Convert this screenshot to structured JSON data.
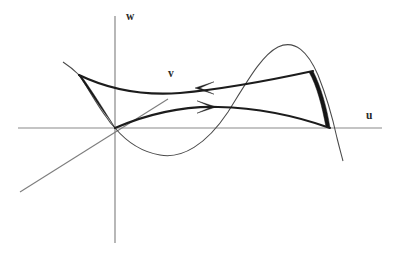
{
  "figure": {
    "title": "",
    "kind": "mathematical-diagram",
    "background_color": "#ffffff",
    "width": 402,
    "height": 258
  },
  "axes": {
    "horizontal": {
      "name": "u-axis",
      "label": "u",
      "label_position": {
        "x": 366,
        "y": 110
      },
      "start": {
        "x": 18,
        "y": 128
      },
      "end": {
        "x": 382,
        "y": 128
      },
      "color": "#8a8a8a"
    },
    "vertical": {
      "name": "w-axis",
      "label": "w",
      "label_position": {
        "x": 126,
        "y": 11
      },
      "start": {
        "x": 115,
        "y": 16
      },
      "end": {
        "x": 115,
        "y": 243
      },
      "color": "#7d7d7d"
    },
    "diagonal": {
      "name": "v-axis",
      "label": "v",
      "label_position": {
        "x": 168,
        "y": 68
      },
      "start": {
        "x": 20,
        "y": 192
      },
      "end": {
        "x": 168,
        "y": 99
      },
      "color": "#7d7d7d"
    }
  },
  "curves": [
    {
      "name": "thin-s-curve",
      "style": "thin",
      "color": "#4a4a4a",
      "note": "sinusoidal fold curve passing through origin, dipping below the u-axis then peaking above it",
      "path": "M 63 62 C 72 68 76 72 78 74 C 86 84 96 104 107 118 C 110 123 113 126 115 128 C 126 141 142 152 160 155 C 182 159 206 145 228 112 C 248 80 262 55 278 47 C 295 39 308 52 318 75 C 326 95 332 115 337 138 C 340 150 342 157 343 161"
    },
    {
      "name": "upper-thick-curve",
      "style": "thick",
      "color": "#1c1c1c",
      "note": "upper fold edge from the left cusp tip sweeping right to the upper right cusp tip",
      "path": "M 79 75 C 108 89 140 96 180 93 C 225 89 276 79 313 71"
    },
    {
      "name": "lower-thick-curve",
      "style": "thick",
      "color": "#1c1c1c",
      "note": "lower fold edge from the origin sweeping right to the lower right cusp point",
      "path": "M 115 128 C 148 114 182 106 218 107 C 262 108 302 118 330 128"
    },
    {
      "name": "left-cusp-wedge",
      "style": "filled-wedge",
      "color": "#161616",
      "note": "narrow dark sliver closing the left cusp between the curve and the fold edge",
      "path": "M 78 74 C 86 85 98 105 110 120 L 115 128 C 106 113 92 91 82 77 Z"
    },
    {
      "name": "right-cusp-wedge",
      "style": "filled-wedge",
      "color": "#161616",
      "note": "narrow dark sliver closing the right cusp between the curve and the fold edge",
      "path": "M 313 71 C 321 87 327 108 330 128 L 326 127 C 322 106 317 86 309 72 Z"
    }
  ],
  "arrows": [
    {
      "name": "upper-flow-arrow",
      "direction": "left",
      "tip": {
        "x": 195,
        "y": 88
      },
      "on_curve": "upper-thick-curve",
      "color": "#1c1c1c"
    },
    {
      "name": "lower-flow-arrow",
      "direction": "right",
      "tip": {
        "x": 216,
        "y": 107
      },
      "on_curve": "lower-thick-curve",
      "color": "#1c1c1c"
    }
  ],
  "labels": {
    "w": "w",
    "u": "u",
    "v": "v"
  },
  "colors": {
    "background": "#ffffff",
    "axis": "#8a8a8a",
    "thin_curve": "#4a4a4a",
    "thick_curve": "#1c1c1c",
    "cusp_fill": "#161616",
    "label_text": "#2a2a2a"
  }
}
